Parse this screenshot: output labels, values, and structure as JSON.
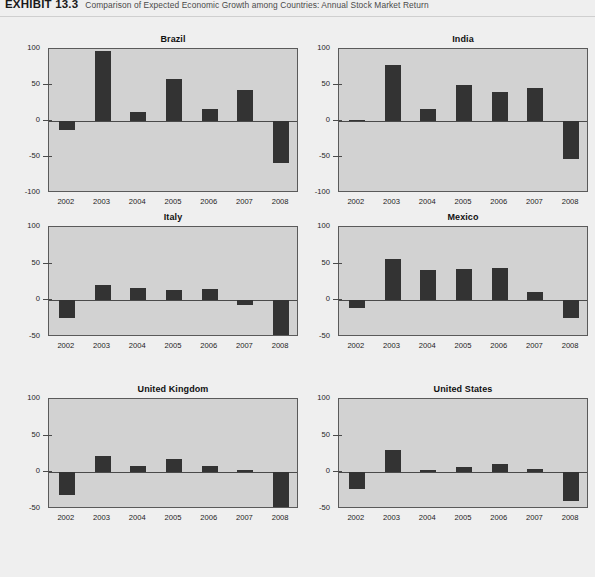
{
  "header": {
    "exhibit_label": "EXHIBIT 13.3",
    "caption": "Comparison of Expected Economic Growth among Countries: Annual Stock Market Return"
  },
  "chart_data": {
    "type": "bar",
    "title": "Comparison of Expected Economic Growth among Countries: Annual Stock Market Return",
    "xlabel": "",
    "ylabel": "",
    "grid": false,
    "legend": "none",
    "layout": {
      "rows": 3,
      "cols": 2
    },
    "categories": [
      "2002",
      "2003",
      "2004",
      "2005",
      "2006",
      "2007",
      "2008"
    ],
    "panels": [
      {
        "title": "Brazil",
        "ylim": [
          -100,
          100
        ],
        "yticks": [
          100,
          50,
          0,
          -50,
          -100
        ],
        "ytick_labels": [
          "100",
          "50",
          "0",
          "-50",
          "-100"
        ],
        "values": [
          -12,
          97,
          12,
          58,
          16,
          43,
          -58
        ]
      },
      {
        "title": "India",
        "ylim": [
          -100,
          100
        ],
        "yticks": [
          100,
          50,
          0,
          -50,
          -100
        ],
        "ytick_labels": [
          "100",
          "50",
          "0",
          "-50",
          "-100"
        ],
        "values": [
          1,
          78,
          17,
          50,
          40,
          46,
          -53
        ]
      },
      {
        "title": "Italy",
        "ylim": [
          -50,
          100
        ],
        "yticks": [
          100,
          50,
          0,
          -50
        ],
        "ytick_labels": [
          "100",
          "50",
          "0",
          "-50"
        ],
        "values": [
          -24,
          21,
          17,
          14,
          16,
          -7,
          -50
        ]
      },
      {
        "title": "Mexico",
        "ylim": [
          -50,
          100
        ],
        "yticks": [
          100,
          50,
          0,
          -50
        ],
        "ytick_labels": [
          "100",
          "50",
          "0",
          "-50"
        ],
        "values": [
          -11,
          57,
          41,
          43,
          44,
          11,
          -24
        ]
      },
      {
        "title": "United Kingdom",
        "ylim": [
          -50,
          100
        ],
        "yticks": [
          100,
          50,
          0,
          -50
        ],
        "ytick_labels": [
          "100",
          "50",
          "0",
          "-50"
        ],
        "values": [
          -31,
          22,
          9,
          18,
          8,
          3,
          -50
        ]
      },
      {
        "title": "United States",
        "ylim": [
          -50,
          100
        ],
        "yticks": [
          100,
          50,
          0,
          -50
        ],
        "ytick_labels": [
          "100",
          "50",
          "0",
          "-50"
        ],
        "values": [
          -23,
          31,
          3,
          7,
          11,
          5,
          -39
        ]
      }
    ],
    "colors": {
      "bar": "#333333",
      "panel_background": "#d2d2d2",
      "page_background": "#efefef",
      "axis": "#5a5a5a",
      "text": "#1d1d1d"
    }
  }
}
